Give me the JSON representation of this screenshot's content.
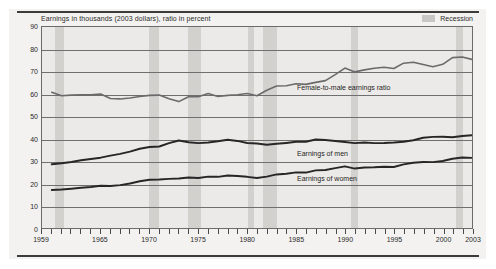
{
  "figure": {
    "subtitle": "Earnings in thousands (2003 dollars), ratio in percent",
    "legend": {
      "recession_label": "Recession",
      "recession_color": "#d3d1ce"
    },
    "annotations": {
      "ratio": "Female-to-male earnings ratio",
      "men": "Earnings of men",
      "women": "Earnings of women"
    }
  },
  "chart_data": {
    "type": "line",
    "title": "",
    "subtitle": "Earnings in thousands (2003 dollars), ratio in percent",
    "xlabel": "",
    "ylabel": "",
    "xlim": [
      1959,
      2003
    ],
    "ylim": [
      0,
      90
    ],
    "grid": true,
    "legend_position": "top-right",
    "y_ticks": [
      0,
      10,
      20,
      30,
      40,
      50,
      60,
      70,
      80,
      90
    ],
    "x_tick_labels": [
      1959,
      1965,
      1970,
      1975,
      1980,
      1985,
      1990,
      1995,
      2000,
      2003
    ],
    "x_minor_tick_step": 1,
    "x": [
      1960,
      1961,
      1962,
      1963,
      1964,
      1965,
      1966,
      1967,
      1968,
      1969,
      1970,
      1971,
      1972,
      1973,
      1974,
      1975,
      1976,
      1977,
      1978,
      1979,
      1980,
      1981,
      1982,
      1983,
      1984,
      1985,
      1986,
      1987,
      1988,
      1989,
      1990,
      1991,
      1992,
      1993,
      1994,
      1995,
      1996,
      1997,
      1998,
      1999,
      2000,
      2001,
      2002,
      2003
    ],
    "series": [
      {
        "name": "Female-to-male earnings ratio",
        "color": "#6a6a6a",
        "unit": "percent",
        "values": [
          60.8,
          59.2,
          59.5,
          59.6,
          59.6,
          60.0,
          58.0,
          57.8,
          58.2,
          58.9,
          59.4,
          59.5,
          57.9,
          56.6,
          58.8,
          58.8,
          60.2,
          58.9,
          59.4,
          59.7,
          60.2,
          59.2,
          61.7,
          63.6,
          63.7,
          64.6,
          64.3,
          65.2,
          66.0,
          68.7,
          71.6,
          69.9,
          70.8,
          71.5,
          72.0,
          71.4,
          73.8,
          74.2,
          73.2,
          72.2,
          73.3,
          76.3,
          76.6,
          75.5
        ]
      },
      {
        "name": "Earnings of men",
        "color": "#262626",
        "unit": "thousands of 2003 dollars",
        "values": [
          28.5,
          29.0,
          29.6,
          30.3,
          30.9,
          31.5,
          32.4,
          33.2,
          34.2,
          35.5,
          36.3,
          36.5,
          38.0,
          39.2,
          38.4,
          38.0,
          38.3,
          38.8,
          39.5,
          39.0,
          38.1,
          37.8,
          37.3,
          37.7,
          38.1,
          38.6,
          38.6,
          39.6,
          39.4,
          39.0,
          38.5,
          38.0,
          38.3,
          38.0,
          38.1,
          38.3,
          38.6,
          39.3,
          40.4,
          40.8,
          40.9,
          40.6,
          41.2,
          41.5
        ]
      },
      {
        "name": "Earnings of women",
        "color": "#262626",
        "unit": "thousands of 2003 dollars",
        "values": [
          17.0,
          17.2,
          17.6,
          18.0,
          18.4,
          18.9,
          18.8,
          19.2,
          19.9,
          20.9,
          21.6,
          21.7,
          22.0,
          22.2,
          22.6,
          22.4,
          23.0,
          22.9,
          23.5,
          23.3,
          22.9,
          22.4,
          23.0,
          24.0,
          24.3,
          24.9,
          24.8,
          25.8,
          26.0,
          26.8,
          27.6,
          26.6,
          27.1,
          27.2,
          27.4,
          27.3,
          28.5,
          29.2,
          29.6,
          29.5,
          30.0,
          31.0,
          31.6,
          31.4
        ]
      }
    ],
    "recession_bands": [
      {
        "start": 1960.3,
        "end": 1961.2
      },
      {
        "start": 1969.9,
        "end": 1970.9
      },
      {
        "start": 1973.9,
        "end": 1975.2
      },
      {
        "start": 1980.0,
        "end": 1980.6
      },
      {
        "start": 1981.5,
        "end": 1982.9
      },
      {
        "start": 1990.5,
        "end": 1991.2
      },
      {
        "start": 2001.2,
        "end": 2001.9
      }
    ]
  }
}
